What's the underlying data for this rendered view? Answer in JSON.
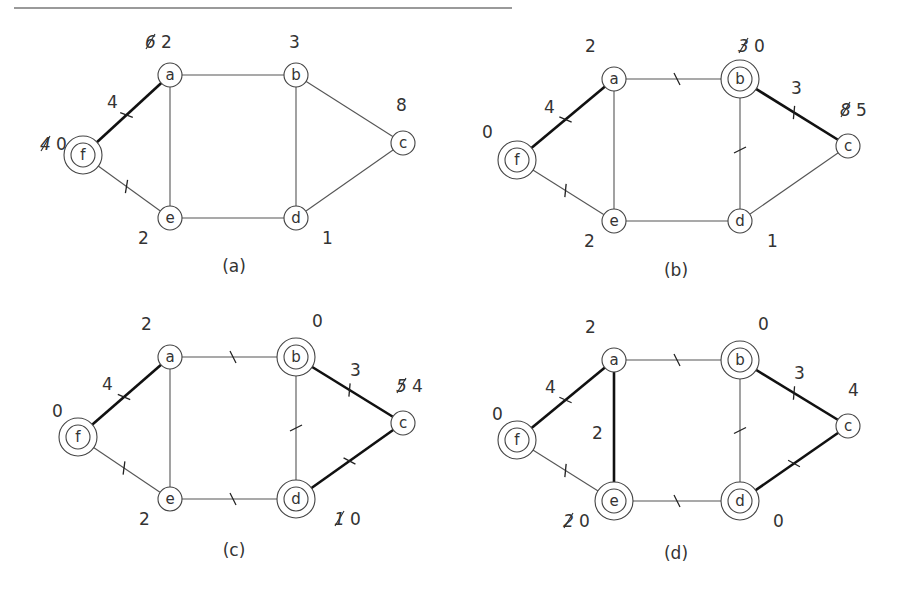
{
  "figure": {
    "panels": [
      {
        "caption": "(a)",
        "nodes": [
          {
            "id": "f",
            "x": 83,
            "y": 155,
            "double": true,
            "dist": "0",
            "old": "4",
            "lx": 40,
            "ly": 150
          },
          {
            "id": "a",
            "x": 170,
            "y": 75,
            "double": false,
            "dist": "2",
            "old": "6",
            "lx": 145,
            "ly": 48
          },
          {
            "id": "b",
            "x": 296,
            "y": 75,
            "double": false,
            "dist": "3",
            "old": "",
            "lx": 289,
            "ly": 48
          },
          {
            "id": "c",
            "x": 403,
            "y": 143,
            "double": false,
            "dist": "8",
            "old": "",
            "lx": 396,
            "ly": 111
          },
          {
            "id": "e",
            "x": 170,
            "y": 218,
            "double": false,
            "dist": "2",
            "old": "",
            "lx": 138,
            "ly": 244
          },
          {
            "id": "d",
            "x": 296,
            "y": 218,
            "double": false,
            "dist": "1",
            "old": "",
            "lx": 322,
            "ly": 244
          }
        ],
        "edges": [
          {
            "from": "f",
            "to": "a",
            "bold": true,
            "tick": true,
            "weight": "4",
            "wx": 107,
            "wy": 108
          },
          {
            "from": "f",
            "to": "e",
            "bold": false,
            "tick": true,
            "weight": "",
            "wx": 0,
            "wy": 0
          },
          {
            "from": "a",
            "to": "b",
            "bold": false,
            "tick": false,
            "weight": "",
            "wx": 0,
            "wy": 0
          },
          {
            "from": "a",
            "to": "e",
            "bold": false,
            "tick": false,
            "weight": "",
            "wx": 0,
            "wy": 0
          },
          {
            "from": "b",
            "to": "c",
            "bold": false,
            "tick": false,
            "weight": "",
            "wx": 0,
            "wy": 0
          },
          {
            "from": "b",
            "to": "d",
            "bold": false,
            "tick": false,
            "weight": "",
            "wx": 0,
            "wy": 0
          },
          {
            "from": "c",
            "to": "d",
            "bold": false,
            "tick": false,
            "weight": "",
            "wx": 0,
            "wy": 0
          },
          {
            "from": "e",
            "to": "d",
            "bold": false,
            "tick": false,
            "weight": "",
            "wx": 0,
            "wy": 0
          }
        ],
        "caption_x": 234,
        "caption_y": 272
      },
      {
        "caption": "(b)",
        "nodes": [
          {
            "id": "f",
            "x": 517,
            "y": 160,
            "double": true,
            "dist": "0",
            "old": "",
            "lx": 482,
            "ly": 138
          },
          {
            "id": "a",
            "x": 614,
            "y": 79,
            "double": false,
            "dist": "2",
            "old": "",
            "lx": 585,
            "ly": 52
          },
          {
            "id": "b",
            "x": 740,
            "y": 79,
            "double": true,
            "dist": "0",
            "old": "3",
            "lx": 738,
            "ly": 52
          },
          {
            "id": "c",
            "x": 848,
            "y": 146,
            "double": false,
            "dist": "5",
            "old": "8",
            "lx": 840,
            "ly": 116
          },
          {
            "id": "e",
            "x": 614,
            "y": 221,
            "double": false,
            "dist": "2",
            "old": "",
            "lx": 584,
            "ly": 247
          },
          {
            "id": "d",
            "x": 740,
            "y": 221,
            "double": false,
            "dist": "1",
            "old": "",
            "lx": 767,
            "ly": 247
          }
        ],
        "edges": [
          {
            "from": "f",
            "to": "a",
            "bold": true,
            "tick": true,
            "weight": "4",
            "wx": 544,
            "wy": 113
          },
          {
            "from": "f",
            "to": "e",
            "bold": false,
            "tick": true,
            "weight": "",
            "wx": 0,
            "wy": 0
          },
          {
            "from": "a",
            "to": "b",
            "bold": false,
            "tick": true,
            "weight": "",
            "wx": 0,
            "wy": 0
          },
          {
            "from": "a",
            "to": "e",
            "bold": false,
            "tick": false,
            "weight": "",
            "wx": 0,
            "wy": 0
          },
          {
            "from": "b",
            "to": "c",
            "bold": true,
            "tick": true,
            "weight": "3",
            "wx": 791,
            "wy": 94
          },
          {
            "from": "b",
            "to": "d",
            "bold": false,
            "tick": true,
            "weight": "",
            "wx": 0,
            "wy": 0
          },
          {
            "from": "c",
            "to": "d",
            "bold": false,
            "tick": false,
            "weight": "",
            "wx": 0,
            "wy": 0
          },
          {
            "from": "e",
            "to": "d",
            "bold": false,
            "tick": false,
            "weight": "",
            "wx": 0,
            "wy": 0
          }
        ],
        "caption_x": 676,
        "caption_y": 276
      },
      {
        "caption": "(c)",
        "nodes": [
          {
            "id": "f",
            "x": 78,
            "y": 437,
            "double": true,
            "dist": "0",
            "old": "",
            "lx": 52,
            "ly": 417
          },
          {
            "id": "a",
            "x": 170,
            "y": 357,
            "double": false,
            "dist": "2",
            "old": "",
            "lx": 141,
            "ly": 330
          },
          {
            "id": "b",
            "x": 296,
            "y": 357,
            "double": true,
            "dist": "0",
            "old": "",
            "lx": 312,
            "ly": 327
          },
          {
            "id": "c",
            "x": 403,
            "y": 423,
            "double": false,
            "dist": "4",
            "old": "5",
            "lx": 396,
            "ly": 392
          },
          {
            "id": "e",
            "x": 170,
            "y": 499,
            "double": false,
            "dist": "2",
            "old": "",
            "lx": 139,
            "ly": 525
          },
          {
            "id": "d",
            "x": 296,
            "y": 499,
            "double": true,
            "dist": "0",
            "old": "1",
            "lx": 334,
            "ly": 525
          }
        ],
        "edges": [
          {
            "from": "f",
            "to": "a",
            "bold": true,
            "tick": true,
            "weight": "4",
            "wx": 102,
            "wy": 390
          },
          {
            "from": "f",
            "to": "e",
            "bold": false,
            "tick": true,
            "weight": "",
            "wx": 0,
            "wy": 0
          },
          {
            "from": "a",
            "to": "b",
            "bold": false,
            "tick": true,
            "weight": "",
            "wx": 0,
            "wy": 0
          },
          {
            "from": "a",
            "to": "e",
            "bold": false,
            "tick": false,
            "weight": "",
            "wx": 0,
            "wy": 0
          },
          {
            "from": "b",
            "to": "c",
            "bold": true,
            "tick": true,
            "weight": "3",
            "wx": 350,
            "wy": 376
          },
          {
            "from": "b",
            "to": "d",
            "bold": false,
            "tick": true,
            "weight": "",
            "wx": 0,
            "wy": 0
          },
          {
            "from": "c",
            "to": "d",
            "bold": true,
            "tick": true,
            "weight": "",
            "wx": 0,
            "wy": 0
          },
          {
            "from": "e",
            "to": "d",
            "bold": false,
            "tick": true,
            "weight": "",
            "wx": 0,
            "wy": 0
          }
        ],
        "caption_x": 234,
        "caption_y": 556
      },
      {
        "caption": "(d)",
        "nodes": [
          {
            "id": "f",
            "x": 517,
            "y": 440,
            "double": true,
            "dist": "0",
            "old": "",
            "lx": 492,
            "ly": 420
          },
          {
            "id": "a",
            "x": 614,
            "y": 360,
            "double": false,
            "dist": "2",
            "old": "",
            "lx": 585,
            "ly": 333
          },
          {
            "id": "b",
            "x": 740,
            "y": 360,
            "double": true,
            "dist": "0",
            "old": "",
            "lx": 758,
            "ly": 330
          },
          {
            "id": "c",
            "x": 848,
            "y": 426,
            "double": false,
            "dist": "4",
            "old": "",
            "lx": 848,
            "ly": 396
          },
          {
            "id": "e",
            "x": 614,
            "y": 501,
            "double": true,
            "dist": "0",
            "old": "2",
            "lx": 563,
            "ly": 527
          },
          {
            "id": "d",
            "x": 740,
            "y": 501,
            "double": true,
            "dist": "0",
            "old": "",
            "lx": 773,
            "ly": 527
          }
        ],
        "edges": [
          {
            "from": "f",
            "to": "a",
            "bold": true,
            "tick": true,
            "weight": "4",
            "wx": 545,
            "wy": 393
          },
          {
            "from": "f",
            "to": "e",
            "bold": false,
            "tick": true,
            "weight": "",
            "wx": 0,
            "wy": 0
          },
          {
            "from": "a",
            "to": "b",
            "bold": false,
            "tick": true,
            "weight": "",
            "wx": 0,
            "wy": 0
          },
          {
            "from": "a",
            "to": "e",
            "bold": true,
            "tick": false,
            "weight": "2",
            "wx": 592,
            "wy": 439
          },
          {
            "from": "b",
            "to": "c",
            "bold": true,
            "tick": true,
            "weight": "3",
            "wx": 794,
            "wy": 379
          },
          {
            "from": "b",
            "to": "d",
            "bold": false,
            "tick": true,
            "weight": "",
            "wx": 0,
            "wy": 0
          },
          {
            "from": "c",
            "to": "d",
            "bold": true,
            "tick": true,
            "weight": "",
            "wx": 0,
            "wy": 0
          },
          {
            "from": "e",
            "to": "d",
            "bold": false,
            "tick": true,
            "weight": "",
            "wx": 0,
            "wy": 0
          }
        ],
        "caption_x": 676,
        "caption_y": 559
      }
    ]
  },
  "style": {
    "edge_color": "#555555",
    "bold_edge_color": "#111111",
    "rule_color": "#9a9a9a"
  }
}
